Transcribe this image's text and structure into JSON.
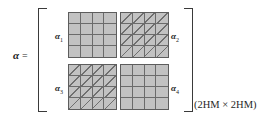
{
  "figure": {
    "type": "block-matrix-equation",
    "lhs": {
      "symbol": "α",
      "equals": "="
    },
    "dimension_label": "(2HM × 2HM)",
    "grid": {
      "rows": 2,
      "cols": 2,
      "cell_rows": 4,
      "cell_cols": 4
    },
    "blocks": [
      {
        "label": "α",
        "subscript": "1",
        "name": "alpha-1",
        "position": "top-left",
        "fill": "solid",
        "fill_color": "#c2c2c2",
        "line_color": "#6b6b6b"
      },
      {
        "label": "α",
        "subscript": "2",
        "name": "alpha-2",
        "position": "top-right",
        "fill": "hatched",
        "fill_color": "#c2c2c2",
        "line_color": "#6b6b6b"
      },
      {
        "label": "α",
        "subscript": "3",
        "name": "alpha-3",
        "position": "bottom-left",
        "fill": "hatched",
        "fill_color": "#c2c2c2",
        "line_color": "#6b6b6b"
      },
      {
        "label": "α",
        "subscript": "4",
        "name": "alpha-4",
        "position": "bottom-right",
        "fill": "solid",
        "fill_color": "#c2c2c2",
        "line_color": "#6b6b6b"
      }
    ],
    "brackets": {
      "left": "[",
      "right": "]",
      "color": "#3a3a3a"
    },
    "background": "#ffffff"
  }
}
